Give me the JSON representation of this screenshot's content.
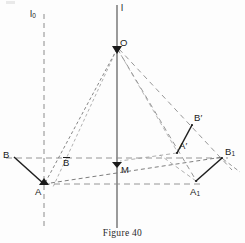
{
  "figure": {
    "caption": "Figure 40",
    "width": 245,
    "height": 243,
    "background_color": "#fdfdfd",
    "ink_color": "#1a1a1a",
    "dash_color": "#7a7a7a"
  },
  "lines": {
    "axis_l0": {
      "label": "l",
      "subscript": "0",
      "style": "dashed",
      "orientation": "vertical",
      "x": 44
    },
    "axis_l": {
      "label": "l",
      "subscript": "",
      "style": "solid",
      "orientation": "vertical",
      "x": 117
    }
  },
  "points": [
    {
      "id": "O",
      "label": "O",
      "subscript": "",
      "prime": false,
      "x": 117,
      "y": 48,
      "label_x": 121,
      "label_y": 39,
      "dot": true
    },
    {
      "id": "B",
      "label": "B",
      "subscript": "",
      "prime": false,
      "x": 14,
      "y": 157,
      "label_x": 4,
      "label_y": 151,
      "dot": false
    },
    {
      "id": "Bbar",
      "label": "B",
      "subscript": "",
      "prime": false,
      "overbar": true,
      "x": 68,
      "y": 158,
      "label_x": 64,
      "label_y": 158,
      "dot": false
    },
    {
      "id": "A",
      "label": "A",
      "subscript": "",
      "prime": false,
      "x": 44,
      "y": 184,
      "label_x": 36,
      "label_y": 188,
      "dot": true
    },
    {
      "id": "M",
      "label": "M",
      "subscript": "",
      "prime": false,
      "x": 117,
      "y": 162,
      "label_x": 122,
      "label_y": 166,
      "dot": true
    },
    {
      "id": "Aprime",
      "label": "A",
      "subscript": "",
      "prime": true,
      "x": 177,
      "y": 153,
      "label_x": 180,
      "label_y": 142,
      "dot": false
    },
    {
      "id": "Bprime",
      "label": "B",
      "subscript": "",
      "prime": true,
      "x": 192,
      "y": 125,
      "label_x": 195,
      "label_y": 114,
      "dot": false
    },
    {
      "id": "A1",
      "label": "A",
      "subscript": "1",
      "prime": false,
      "x": 196,
      "y": 181,
      "label_x": 191,
      "label_y": 188,
      "dot": false
    },
    {
      "id": "B1",
      "label": "B",
      "subscript": "1",
      "prime": false,
      "x": 222,
      "y": 158,
      "label_x": 226,
      "label_y": 148,
      "dot": false
    }
  ],
  "segments_solid": [
    {
      "from": "B",
      "to": "A",
      "name": "segment-B-A"
    },
    {
      "from": "A1",
      "to": "B1",
      "name": "segment-A1-B1"
    },
    {
      "from": "Aprime",
      "to": "Bprime",
      "name": "segment-Aprime-Bprime"
    }
  ],
  "segments_dashed": [
    {
      "from": "O",
      "to": "A",
      "name": "ray-O-A"
    },
    {
      "from": "O",
      "to": "Bbar",
      "name": "ray-O-Bbar"
    },
    {
      "from": "O",
      "to": "Aprime",
      "name": "ray-O-Aprime"
    },
    {
      "from": "O",
      "to": "Bprime",
      "name": "ray-O-Bprime"
    },
    {
      "from": "A",
      "to": "B1",
      "name": "line-A-M-B1"
    },
    {
      "from": "A",
      "to": "A1",
      "name": "line-A-A1-horizontal"
    },
    {
      "from": "B",
      "to": "B1",
      "name": "line-B-B1-horizontal"
    },
    {
      "from": "A1",
      "to": "Aprime",
      "name": "line-A1-Aprime"
    },
    {
      "from": "A1",
      "to": "Bprime",
      "name": "line-A1-Bprime"
    }
  ],
  "annotations": {
    "arrow_markers": [
      "O",
      "A",
      "M"
    ]
  }
}
